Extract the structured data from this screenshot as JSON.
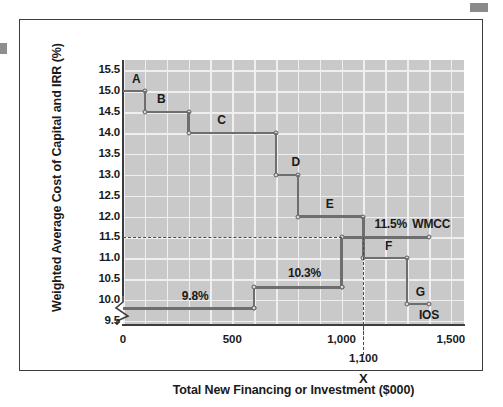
{
  "figure": {
    "y_axis_title": "Weighted Average Cost of Capital and IRR (%)",
    "x_axis_title": "Total New Financing or Investment ($000)",
    "crossing_marker": "X",
    "crossing_label": "1,100"
  },
  "chart_data": {
    "type": "line",
    "title": "",
    "xlabel": "Total New Financing or Investment ($000)",
    "ylabel": "Weighted Average Cost of Capital and IRR (%)",
    "xlim": [
      0,
      1500
    ],
    "ylim": [
      9.5,
      15.5
    ],
    "xticks": [
      0,
      500,
      1000,
      1500
    ],
    "xtick_labels": [
      "0",
      "500",
      "1,000",
      "1,500"
    ],
    "yticks": [
      9.5,
      10.0,
      10.5,
      11.0,
      11.5,
      12.0,
      12.5,
      13.0,
      13.5,
      14.0,
      14.5,
      15.0,
      15.5
    ],
    "ytick_labels": [
      "9.5",
      "10.0",
      "10.5",
      "11.0",
      "11.5",
      "12.0",
      "12.5",
      "13.0",
      "13.5",
      "14.0",
      "14.5",
      "15.0",
      "15.5"
    ],
    "grid": true,
    "grid_color": "#efefef",
    "plot_bg": "#c9c9c9",
    "line_color": "#6e6e6e",
    "y_axis_break": true,
    "series": [
      {
        "name": "IOS",
        "label": "IOS",
        "type": "step",
        "steps": [
          {
            "label": "A",
            "x_start": 0,
            "x_end": 100,
            "irr": 15.0
          },
          {
            "label": "B",
            "x_start": 100,
            "x_end": 300,
            "irr": 14.5
          },
          {
            "label": "C",
            "x_start": 300,
            "x_end": 700,
            "irr": 14.0
          },
          {
            "label": "D",
            "x_start": 700,
            "x_end": 800,
            "irr": 13.0
          },
          {
            "label": "E",
            "x_start": 800,
            "x_end": 1100,
            "irr": 12.0
          },
          {
            "label": "F",
            "x_start": 1100,
            "x_end": 1300,
            "irr": 11.0
          },
          {
            "label": "G",
            "x_start": 1300,
            "x_end": 1400,
            "irr": 9.9
          }
        ]
      },
      {
        "name": "WMCC",
        "label": "WMCC",
        "type": "step",
        "steps": [
          {
            "label": "9.8%",
            "x_start": 0,
            "x_end": 600,
            "wacc": 9.8
          },
          {
            "label": "10.3%",
            "x_start": 600,
            "x_end": 1000,
            "wacc": 10.3
          },
          {
            "label": "11.5%",
            "x_start": 1000,
            "x_end": 1400,
            "wacc": 11.5
          }
        ]
      }
    ],
    "annotations": [
      {
        "name": "ios-step-a",
        "text": "A",
        "x": 60,
        "y": 15.28
      },
      {
        "name": "ios-step-b",
        "text": "B",
        "x": 175,
        "y": 14.78
      },
      {
        "name": "ios-step-c",
        "text": "C",
        "x": 450,
        "y": 14.28
      },
      {
        "name": "ios-step-d",
        "text": "D",
        "x": 790,
        "y": 13.28
      },
      {
        "name": "ios-step-e",
        "text": "E",
        "x": 945,
        "y": 12.27
      },
      {
        "name": "ios-step-f",
        "text": "F",
        "x": 1215,
        "y": 11.27
      },
      {
        "name": "ios-step-g",
        "text": "G",
        "x": 1360,
        "y": 10.17
      },
      {
        "name": "wmcc-rate-98",
        "text": "9.8%",
        "x": 330,
        "y": 10.08
      },
      {
        "name": "wmcc-rate-103",
        "text": "10.3%",
        "x": 830,
        "y": 10.62
      },
      {
        "name": "wmcc-rate-115",
        "text": "11.5%",
        "x": 1225,
        "y": 11.8
      },
      {
        "name": "wmcc-curve-label",
        "text": "WMCC",
        "x": 1410,
        "y": 11.8
      },
      {
        "name": "ios-curve-label",
        "text": "IOS",
        "x": 1400,
        "y": 9.62
      }
    ],
    "reference_lines": [
      {
        "name": "wmcc-optimal-hline",
        "orientation": "horizontal",
        "value": 11.5,
        "style": "dashed",
        "x_from": 0,
        "x_to": 1000
      },
      {
        "name": "optimal-budget-vline",
        "orientation": "vertical",
        "value": 1100,
        "style": "dashed",
        "y_from": 9.5,
        "y_to": 11.5
      }
    ]
  }
}
